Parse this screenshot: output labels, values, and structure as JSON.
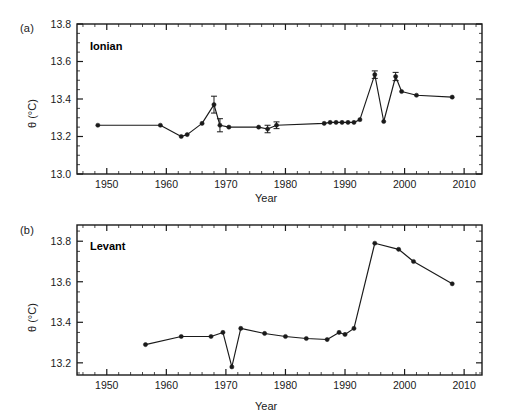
{
  "figure": {
    "background": "#ffffff",
    "ink_color": "#1a1a1a",
    "width": 506,
    "height": 417
  },
  "panels": [
    {
      "tag": "(a)",
      "title": "Ionian",
      "xlabel": "Year",
      "ylabel": "θ (°C)"
    },
    {
      "tag": "(b)",
      "title": "Levant",
      "xlabel": "Year",
      "ylabel": "θ (°C)"
    }
  ],
  "chart_data": [
    {
      "type": "line",
      "title": "Ionian",
      "panel_tag": "(a)",
      "xlabel": "Year",
      "ylabel": "θ (°C)",
      "xlim": [
        1945,
        2013
      ],
      "ylim": [
        13.0,
        13.8
      ],
      "xticks": [
        1950,
        1960,
        1970,
        1980,
        1990,
        2000,
        2010
      ],
      "yticks": [
        13.0,
        13.2,
        13.4,
        13.6,
        13.8
      ],
      "xtick_labels": [
        "1950",
        "1960",
        "1970",
        "1980",
        "1990",
        "2000",
        "2010"
      ],
      "ytick_labels": [
        "13.0",
        "13.2",
        "13.4",
        "13.6",
        "13.8"
      ],
      "x_minor_interval": 2,
      "y_minor_interval": 0.05,
      "grid": false,
      "legend": null,
      "marker": "filled-circle",
      "x": [
        1948.5,
        1959.0,
        1962.5,
        1963.5,
        1966.0,
        1968.0,
        1969.0,
        1970.5,
        1975.5,
        1977.0,
        1978.5,
        1986.5,
        1987.5,
        1988.5,
        1989.5,
        1990.5,
        1991.5,
        1992.5,
        1995.0,
        1996.5,
        1998.5,
        1999.5,
        2002.0,
        2008.0
      ],
      "y": [
        13.26,
        13.26,
        13.2,
        13.21,
        13.27,
        13.37,
        13.26,
        13.25,
        13.25,
        13.24,
        13.26,
        13.27,
        13.275,
        13.275,
        13.275,
        13.275,
        13.275,
        13.29,
        13.53,
        13.28,
        13.52,
        13.44,
        13.42,
        13.41
      ],
      "yerr": [
        0,
        0,
        0,
        0,
        0,
        0.045,
        0.035,
        0,
        0,
        0.02,
        0.018,
        0,
        0,
        0,
        0,
        0,
        0,
        0,
        0.02,
        0,
        0.022,
        0,
        0,
        0
      ]
    },
    {
      "type": "line",
      "title": "Levant",
      "panel_tag": "(b)",
      "xlabel": "Year",
      "ylabel": "θ (°C)",
      "xlim": [
        1945,
        2013
      ],
      "ylim": [
        13.14,
        13.88
      ],
      "xticks": [
        1950,
        1960,
        1970,
        1980,
        1990,
        2000,
        2010
      ],
      "yticks": [
        13.2,
        13.4,
        13.6,
        13.8
      ],
      "xtick_labels": [
        "1950",
        "1960",
        "1970",
        "1980",
        "1990",
        "2000",
        "2010"
      ],
      "ytick_labels": [
        "13.2",
        "13.4",
        "13.6",
        "13.8"
      ],
      "x_minor_interval": 2,
      "y_minor_interval": 0.05,
      "grid": false,
      "legend": null,
      "marker": "filled-circle",
      "x": [
        1956.5,
        1962.5,
        1967.5,
        1969.5,
        1971.0,
        1972.5,
        1976.5,
        1980.0,
        1983.5,
        1987.0,
        1989.0,
        1990.0,
        1991.5,
        1995.0,
        1999.0,
        2001.5,
        2008.0
      ],
      "y": [
        13.29,
        13.33,
        13.33,
        13.35,
        13.18,
        13.37,
        13.345,
        13.33,
        13.32,
        13.315,
        13.35,
        13.34,
        13.37,
        13.79,
        13.76,
        13.7,
        13.59
      ],
      "yerr": [
        0,
        0,
        0,
        0,
        0,
        0,
        0,
        0,
        0,
        0,
        0,
        0,
        0,
        0,
        0,
        0,
        0
      ]
    }
  ]
}
